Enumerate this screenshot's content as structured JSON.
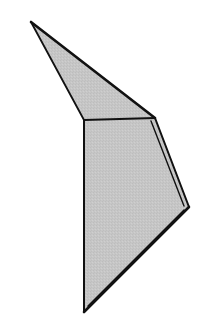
{
  "figure": {
    "width": 208,
    "height": 327,
    "background": "#ffffff",
    "fill_color": "#c6c6c6",
    "stroke_color": "#111111",
    "faces": [
      {
        "name": "upper-triangle-face",
        "points": "31,22 155,118 84,120"
      },
      {
        "name": "lower-quad-face",
        "points": "84,120 155,118 189,207 84,312"
      }
    ],
    "edges": {
      "outer_upper": "31,22 155,118",
      "outer_left_top": "31,22 84,120",
      "fold_line": "84,120 155,118",
      "left_vertical": "84,120 84,312",
      "right_upper": "155,118 189,207",
      "right_lower": "189,207 84,312",
      "inner_parallel_upper": "151,121 184,206",
      "inner_parallel_lower": "184,210 88,306"
    }
  }
}
